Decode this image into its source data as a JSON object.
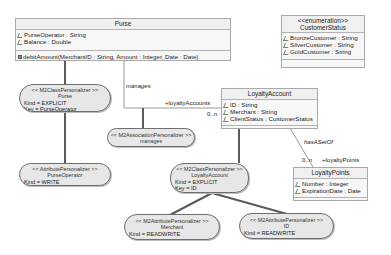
{
  "classes": {
    "purse": {
      "name": "Purse",
      "attributes": [
        "PurseOperator : String",
        "Balance : Double"
      ],
      "operations": [
        "debitAmount(MerchantID : String, Amount : Integer, Date : Date)"
      ]
    },
    "customer_status": {
      "stereotype": "<<enumeration>>",
      "name": "CustomerStatus",
      "attributes": [
        "BronzeCustomer : String",
        "SilverCustomer : String",
        "GoldCustomer : String"
      ]
    },
    "loyalty_account": {
      "name": "LoyaltyAccount",
      "attributes": [
        "ID : String",
        "Merchant : String",
        "ClientStatus : CustomerStatus"
      ]
    },
    "loyalty_points": {
      "name": "LoyaltyPoints",
      "attributes": [
        "Number : Integer",
        "ExpirationDate : Date"
      ]
    }
  },
  "associations": {
    "manages": {
      "name": "manages",
      "target_role": "+loyaltyAccounts",
      "target_multiplicity": "0..n"
    },
    "has_a_set_of": {
      "name": "hasASetOf",
      "target_role": "+loyaltyPoints",
      "target_multiplicity": "0..n"
    }
  },
  "personalizers": {
    "purse_class": {
      "stereotype": "<< M2ClassPersonalizer >>",
      "name": "Purse",
      "kind": "Kind = EXPLICIT",
      "key": "Key = PurseOperator"
    },
    "purse_operator_attr": {
      "stereotype": "<< AttributePersonalizer >>",
      "name": "PurseOperator",
      "kind": "Kind = WRITE"
    },
    "manages_assoc": {
      "stereotype": "<< M2AssociationPersonalizer >>",
      "name": "manages"
    },
    "loyalty_account_class": {
      "stereotype": "<< M2ClassPersonalizer >>",
      "name": "LoyaltyAccount",
      "kind": "Kind = EXPLICIT",
      "key": "Key = ID"
    },
    "merchant_attr": {
      "stereotype": "<< M2AttributePersonalizer >>",
      "name": "Merchant",
      "kind": "Kind = READWRITE"
    },
    "id_attr": {
      "stereotype": "<< M2AttributePersonalizer >>",
      "name": "ID",
      "kind": "Kind = READWRITE"
    }
  },
  "colors": {
    "class_border": "#a9a9a9",
    "class_fill": "#f7f7f7",
    "personalizer_fill": "#e7e7e7",
    "personalizer_border": "#6e6e6e",
    "thick_connector": "#5a5a5a",
    "association_line": "#9a9a9a"
  }
}
